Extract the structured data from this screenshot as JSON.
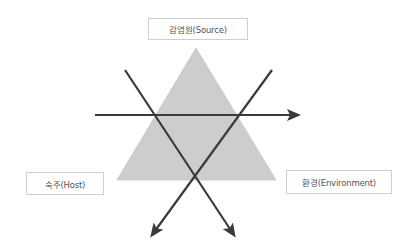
{
  "diagram": {
    "nodes": {
      "source": {
        "label": "감염원(Source)"
      },
      "host": {
        "label": "숙주(Host)"
      },
      "environment": {
        "label": "환경(Environment)"
      }
    },
    "triangle": {
      "fill": "#cfcfcf",
      "vertices": [
        [
          196,
          48
        ],
        [
          117,
          180
        ],
        [
          276,
          180
        ]
      ]
    },
    "arrows": [
      {
        "name": "horizontal-arrow",
        "from": [
          95,
          115
        ],
        "to": [
          300,
          115
        ]
      },
      {
        "name": "diagonal-arrow-down-right",
        "from": [
          125,
          70
        ],
        "to": [
          236,
          238
        ]
      },
      {
        "name": "diagonal-arrow-down-left",
        "from": [
          272,
          70
        ],
        "to": [
          150,
          238
        ]
      }
    ],
    "colors": {
      "arrow": "#3a3a3a",
      "box_border": "#cfcfcf",
      "text": "#555555"
    }
  }
}
